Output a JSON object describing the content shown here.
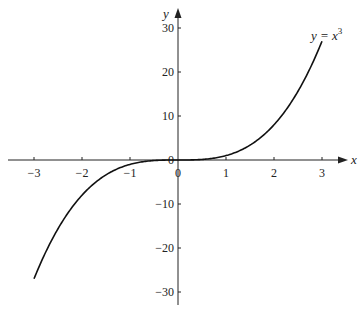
{
  "chart_data": {
    "type": "line",
    "title": "",
    "xlabel": "x",
    "ylabel": "y",
    "xlim": [
      -3.4,
      3.4
    ],
    "ylim": [
      -32,
      33
    ],
    "grid": false,
    "legend": "none",
    "x_ticks": [
      -3,
      -2,
      -1,
      0,
      1,
      2,
      3
    ],
    "y_ticks": [
      -30,
      -20,
      -10,
      0,
      10,
      20,
      30
    ],
    "x_tick_labels": [
      "−3",
      "−2",
      "−1",
      "0",
      "1",
      "2",
      "3"
    ],
    "y_tick_labels": [
      "−30",
      "−20",
      "−10",
      "0",
      "10",
      "20",
      "30"
    ],
    "series": [
      {
        "name": "y = x^3",
        "function": "x^3",
        "domain": [
          -3,
          3
        ],
        "x": [
          -3,
          -2.5,
          -2,
          -1.5,
          -1,
          -0.5,
          0,
          0.5,
          1,
          1.5,
          2,
          2.5,
          3
        ],
        "values": [
          -27,
          -15.625,
          -8,
          -3.375,
          -1,
          -0.125,
          0,
          0.125,
          1,
          3.375,
          8,
          15.625,
          27
        ]
      }
    ],
    "annotations": [
      {
        "text": "y = x",
        "superscript": "3",
        "x": 2.75,
        "y": 29
      }
    ]
  },
  "labels": {
    "x_axis": "x",
    "y_axis": "y",
    "curve_eq_base": "y = x",
    "curve_eq_exp": "3",
    "origin_y": "0",
    "origin_x": "0"
  }
}
